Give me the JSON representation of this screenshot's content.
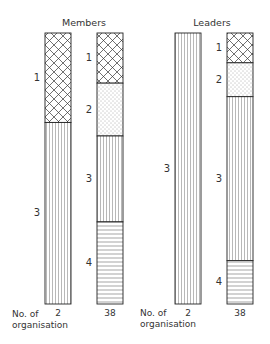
{
  "chart_data": {
    "type": "bar",
    "stacked": true,
    "unit": "percent",
    "categories_axis_label": "No. of organisation",
    "legend": [
      {
        "key": "1",
        "pattern": "crosshatch"
      },
      {
        "key": "2",
        "pattern": "dotted"
      },
      {
        "key": "3",
        "pattern": "vertical-lines"
      },
      {
        "key": "4",
        "pattern": "horizontal-lines"
      }
    ],
    "groups": [
      {
        "title": "Members",
        "bars": [
          {
            "category": "2",
            "segments": [
              {
                "label": "1",
                "pattern": "crosshatch",
                "value": 33
              },
              {
                "label": "3",
                "pattern": "vertical-lines",
                "value": 67
              }
            ]
          },
          {
            "category": "38",
            "segments": [
              {
                "label": "1",
                "pattern": "crosshatch",
                "value": 18.5
              },
              {
                "label": "2",
                "pattern": "dotted",
                "value": 19.5
              },
              {
                "label": "3",
                "pattern": "vertical-lines",
                "value": 31.7
              },
              {
                "label": "4",
                "pattern": "horizontal-lines",
                "value": 30.3
              }
            ]
          }
        ]
      },
      {
        "title": "Leaders",
        "bars": [
          {
            "category": "2",
            "segments": [
              {
                "label": "3",
                "pattern": "vertical-lines",
                "value": 100
              }
            ]
          },
          {
            "category": "38",
            "segments": [
              {
                "label": "1",
                "pattern": "crosshatch",
                "value": 11
              },
              {
                "label": "2",
                "pattern": "dotted",
                "value": 12.5
              },
              {
                "label": "3",
                "pattern": "vertical-lines",
                "value": 60.5
              },
              {
                "label": "4",
                "pattern": "horizontal-lines",
                "value": 16
              }
            ]
          }
        ]
      }
    ]
  },
  "axis_label_line1": "No. of",
  "axis_label_line2": "organisation"
}
